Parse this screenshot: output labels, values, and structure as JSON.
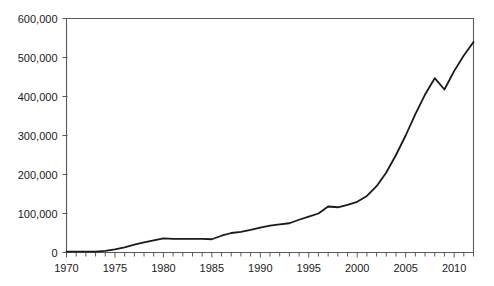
{
  "chart_data": {
    "type": "line",
    "title": "",
    "subtitle": "",
    "xlabel": "",
    "ylabel": "",
    "xlim": [
      1970,
      2012
    ],
    "ylim": [
      0,
      600000
    ],
    "grid": false,
    "legend_position": "none",
    "annotations": [],
    "x_tick_labels": [
      "1970",
      "1975",
      "1980",
      "1985",
      "1990",
      "1995",
      "2000",
      "2005",
      "2010"
    ],
    "x_tick_label_values": [
      1970,
      1975,
      1980,
      1985,
      1990,
      1995,
      2000,
      2005,
      2010
    ],
    "x_minor_tick_interval": 1,
    "y_tick_labels": [
      "0",
      "100,000",
      "200,000",
      "300,000",
      "400,000",
      "500,000",
      "600,000"
    ],
    "y_tick_label_values": [
      0,
      100000,
      200000,
      300000,
      400000,
      500000,
      600000
    ],
    "series": [
      {
        "name": "series-1",
        "color": "#1a1a1a",
        "x": [
          1970,
          1971,
          1972,
          1973,
          1974,
          1975,
          1976,
          1977,
          1978,
          1979,
          1980,
          1981,
          1982,
          1983,
          1984,
          1985,
          1986,
          1987,
          1988,
          1989,
          1990,
          1991,
          1992,
          1993,
          1994,
          1995,
          1996,
          1997,
          1998,
          1999,
          2000,
          2001,
          2002,
          2003,
          2004,
          2005,
          2006,
          2007,
          2008,
          2009,
          2010,
          2011,
          2012
        ],
        "values": [
          2000,
          2000,
          2000,
          2500,
          4000,
          8000,
          13000,
          20000,
          26000,
          31000,
          36000,
          35000,
          35000,
          35000,
          35000,
          34000,
          43000,
          50000,
          53000,
          58000,
          64000,
          69000,
          72000,
          75000,
          84000,
          92000,
          100000,
          118000,
          116000,
          122000,
          130000,
          145000,
          170000,
          205000,
          250000,
          300000,
          355000,
          405000,
          447000,
          418000,
          465000,
          505000,
          540000
        ]
      }
    ]
  },
  "axis": {
    "frame_color": "#5a5a5a",
    "line_color": "#1a1a1a"
  }
}
